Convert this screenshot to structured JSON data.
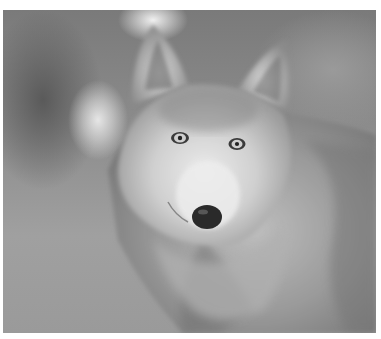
{
  "image": {
    "alt": "Grayscale photograph of a gray wolf looking toward the viewer",
    "subject": "wolf",
    "colors": {
      "background_dark": "#5a5a5a",
      "background_mid": "#8e8e8e",
      "highlight": "#e6e6e6",
      "fur_light": "#d8d8d8",
      "fur_dark": "#6a6a6a",
      "nose": "#2a2a2a",
      "border": "#ffffff"
    }
  }
}
